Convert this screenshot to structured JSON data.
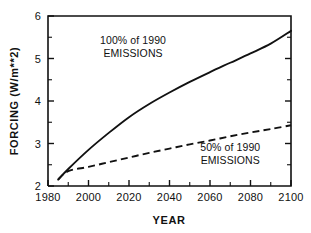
{
  "chart_data": {
    "type": "line",
    "title": "",
    "xlabel": "YEAR",
    "ylabel": "FORCING  (W/m**2)",
    "xlim": [
      1980,
      2100
    ],
    "ylim": [
      2,
      6
    ],
    "grid": false,
    "legend_position": "inline-annotation",
    "x_ticks_major": [
      1980,
      2000,
      2020,
      2040,
      2060,
      2080,
      2100
    ],
    "x_ticks_minor": [
      1990,
      2010,
      2030,
      2050,
      2070,
      2090
    ],
    "x_tick_labels": [
      "1980",
      "2000",
      "2020",
      "2040",
      "2060",
      "2080",
      "2100"
    ],
    "y_ticks_major": [
      2,
      3,
      4,
      5,
      6
    ],
    "y_ticks_minor": [
      2.5,
      3.5,
      4.5,
      5.5
    ],
    "y_tick_labels": [
      "2",
      "3",
      "4",
      "5",
      "6"
    ],
    "series": [
      {
        "name": "100% of 1990 EMISSIONS",
        "style": "solid",
        "x": [
          1985,
          1990,
          2000,
          2010,
          2020,
          2030,
          2040,
          2050,
          2060,
          2070,
          2080,
          2090,
          2100
        ],
        "values": [
          2.15,
          2.4,
          2.85,
          3.25,
          3.62,
          3.93,
          4.2,
          4.45,
          4.68,
          4.9,
          5.12,
          5.35,
          5.65
        ]
      },
      {
        "name": "50% of 1990 EMISSIONS",
        "style": "dashed",
        "x": [
          1985,
          1990,
          2000,
          2010,
          2020,
          2030,
          2040,
          2050,
          2060,
          2070,
          2080,
          2090,
          2100
        ],
        "values": [
          2.15,
          2.35,
          2.45,
          2.56,
          2.67,
          2.78,
          2.88,
          2.98,
          3.07,
          3.17,
          3.26,
          3.34,
          3.43
        ]
      }
    ],
    "annotations": [
      {
        "id": "upper",
        "line1": "100% of 1990",
        "line2": "EMISSIONS",
        "x_data": 2022,
        "y_data": 5.35
      },
      {
        "id": "lower",
        "line1": "50% of 1990",
        "line2": "EMISSIONS",
        "x_data": 2070,
        "y_data": 2.83
      }
    ],
    "colors": {
      "line": "#111111",
      "axis": "#111111",
      "background": "#ffffff"
    }
  }
}
